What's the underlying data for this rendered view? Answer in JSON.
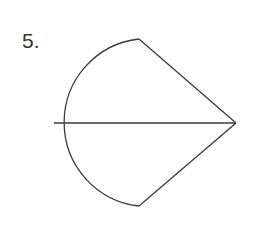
{
  "problem": {
    "number_label": "5."
  },
  "figure": {
    "stroke_color": "#3a3a3a",
    "background": "#ffffff",
    "shape": "semicircle joined with triangle (kite-like) with horizontal diameter line",
    "points": {
      "arc_top": [
        139,
        39
      ],
      "arc_left": [
        54,
        123
      ],
      "arc_bottom": [
        139,
        206
      ],
      "right_vertex": [
        236,
        123
      ]
    },
    "arc_radius": 84
  }
}
